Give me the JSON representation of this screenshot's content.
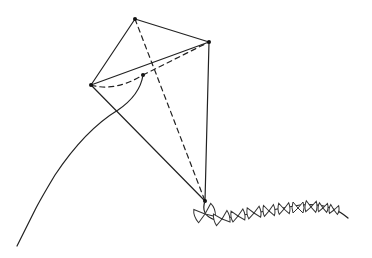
{
  "figure": {
    "vertices": {
      "top": [
        135,
        19
      ],
      "right": [
        209,
        42
      ],
      "left": [
        91,
        85
      ],
      "inner": [
        143,
        75
      ],
      "bottom": [
        205,
        201
      ]
    },
    "line_color": "#222222",
    "background": "#ffffff",
    "tail_bows": 10
  }
}
